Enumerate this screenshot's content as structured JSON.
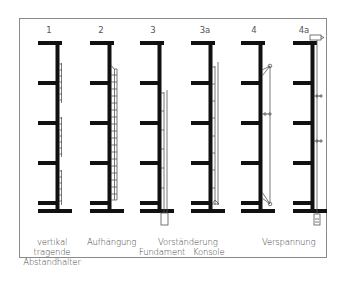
{
  "diagram": {
    "type": "facade anchoring systems schematic",
    "columns": [
      {
        "id": "1",
        "label": "1",
        "system": "vertikal tragende Abstandhalter"
      },
      {
        "id": "2",
        "label": "2",
        "system": "Aufhängung"
      },
      {
        "id": "3",
        "label": "3",
        "system": "Vorständerung – Fundament"
      },
      {
        "id": "3a",
        "label": "3a",
        "system": "Vorständerung – Konsole"
      },
      {
        "id": "4",
        "label": "4",
        "system": "Verspannung"
      },
      {
        "id": "4a",
        "label": "4a",
        "system": "Verspannung"
      }
    ],
    "captions": {
      "col1_line1": "vertikal",
      "col1_line2": "tragende",
      "col1_line3": "Abstandhalter",
      "col2": "Aufhängung",
      "col3_group": "Vorständerung",
      "col3_sub": "Fundament",
      "col3a_sub": "Konsole",
      "col4_group": "Verspannung"
    },
    "colors": {
      "structure": "#111111",
      "facade_line": "#555555",
      "frame": "#8a8a8a",
      "text": "#444444"
    }
  }
}
